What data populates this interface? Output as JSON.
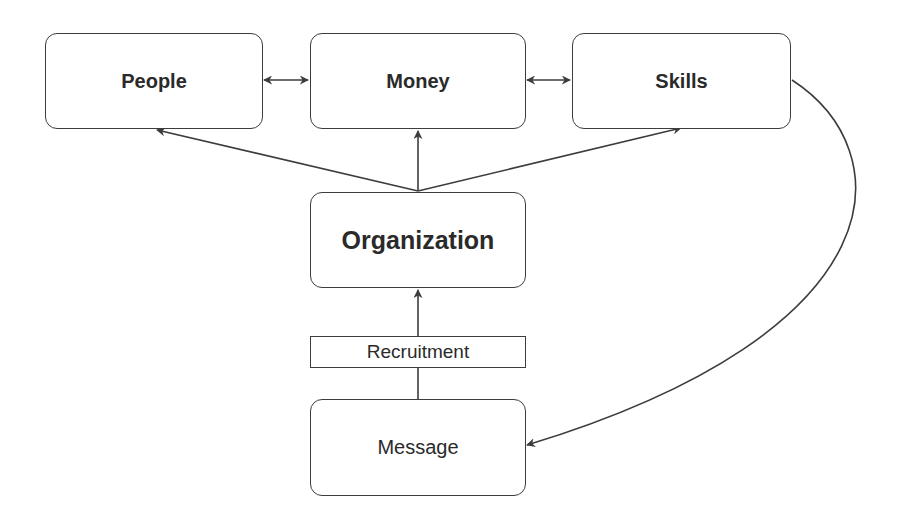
{
  "diagram": {
    "nodes": {
      "people": "People",
      "money": "Money",
      "skills": "Skills",
      "organization": "Organization",
      "message": "Message"
    },
    "edge_labels": {
      "recruitment": "Recruitment"
    },
    "edges": [
      {
        "from": "People",
        "to": "Money",
        "type": "bidirectional"
      },
      {
        "from": "Money",
        "to": "Skills",
        "type": "bidirectional"
      },
      {
        "from": "Organization",
        "to": "People",
        "type": "directed"
      },
      {
        "from": "Organization",
        "to": "Money",
        "type": "directed"
      },
      {
        "from": "Organization",
        "to": "Skills",
        "type": "directed"
      },
      {
        "from": "Message",
        "to": "Organization",
        "type": "directed",
        "label": "Recruitment"
      },
      {
        "from": "Skills",
        "to": "Message",
        "type": "directed-curved"
      }
    ],
    "colors": {
      "stroke": "#3c3c3c",
      "text": "#2a2a2a",
      "background": "#ffffff"
    }
  }
}
